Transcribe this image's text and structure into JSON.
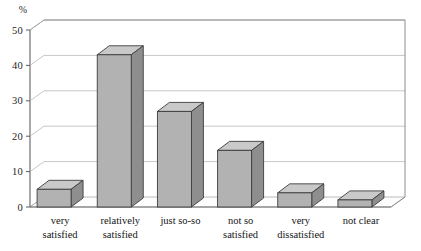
{
  "chart_data": {
    "type": "bar",
    "title": "",
    "subtitle": "",
    "xlabel": "",
    "ylabel": "%",
    "ylim": [
      0,
      50
    ],
    "ytick_labels": [
      "0",
      "10",
      "20",
      "30",
      "40",
      "50"
    ],
    "ytick_values": [
      0,
      10,
      20,
      30,
      40,
      50
    ],
    "grid": true,
    "legend": "none",
    "style": "3d-bar",
    "categories": [
      "very satisfied",
      "relatively satisfied",
      "just so-so",
      "not so satisfied",
      "very dissatisfied",
      "not clear"
    ],
    "category_lines": [
      [
        "very",
        "satisfied"
      ],
      [
        "relatively",
        "satisfied"
      ],
      [
        "just so-so",
        ""
      ],
      [
        "not so",
        "satisfied"
      ],
      [
        "very",
        "dissatisfied"
      ],
      [
        "not clear",
        ""
      ]
    ],
    "values": [
      5,
      43,
      27,
      16,
      4,
      2
    ],
    "colors": {
      "bar_front": "#b2b2b2",
      "bar_side": "#8e8e8e",
      "bar_top": "#c9c9c9",
      "bar_edge": "#3d3d3d",
      "grid": "#b9b9b9",
      "axis": "#6f6f6f",
      "background": "#ffffff",
      "text": "#1a1a1a"
    }
  },
  "axis": {
    "unit": "%",
    "ticks": [
      {
        "label": "50",
        "value": 50
      },
      {
        "label": "40",
        "value": 40
      },
      {
        "label": "30",
        "value": 30
      },
      {
        "label": "20",
        "value": 20
      },
      {
        "label": "10",
        "value": 10
      },
      {
        "label": "0",
        "value": 0
      }
    ]
  },
  "bars": [
    {
      "label_line1": "very",
      "label_line2": "satisfied",
      "value": 5
    },
    {
      "label_line1": "relatively",
      "label_line2": "satisfied",
      "value": 43
    },
    {
      "label_line1": "just so-so",
      "label_line2": "",
      "value": 27
    },
    {
      "label_line1": "not so",
      "label_line2": "satisfied",
      "value": 16
    },
    {
      "label_line1": "very",
      "label_line2": "dissatisfied",
      "value": 4
    },
    {
      "label_line1": "not clear",
      "label_line2": "",
      "value": 2
    }
  ]
}
